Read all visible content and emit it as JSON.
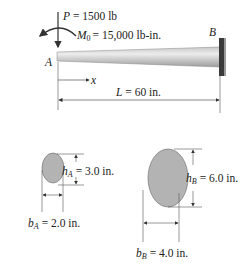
{
  "beam": {
    "end_a_label": "A",
    "end_b_label": "B",
    "load_label": "P = 1500 lb",
    "load_symbol": "P",
    "load_value": "= 1500 lb",
    "moment_symbol": "M",
    "moment_subscript": "0",
    "moment_value": "= 15,000 lb-in.",
    "x_axis_label": "x",
    "length_symbol": "L",
    "length_value": "= 60 in."
  },
  "section_a": {
    "height_symbol": "h",
    "height_subscript": "A",
    "height_value": "= 3.0 in.",
    "width_symbol": "b",
    "width_subscript": "A",
    "width_value": "= 2.0 in."
  },
  "section_b": {
    "height_symbol": "h",
    "height_subscript": "B",
    "height_value": "= 6.0 in.",
    "width_symbol": "b",
    "width_subscript": "B",
    "width_value": "= 4.0 in."
  },
  "colors": {
    "section_fill": "#b3b3b3",
    "beam_light": "#e6e6e6",
    "beam_dark": "#a8a8a8",
    "wall": "#3a3a3a",
    "line": "#333333"
  }
}
